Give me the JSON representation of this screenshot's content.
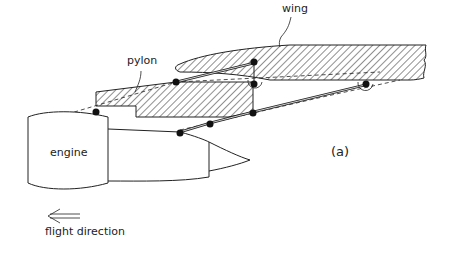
{
  "diagram": {
    "labels": {
      "wing": "wing",
      "pylon": "pylon",
      "engine": "engine",
      "panel": "(a)",
      "flight_direction": "flight direction"
    },
    "colors": {
      "stroke": "#222222",
      "hatch": "#222222",
      "background": "#ffffff"
    }
  }
}
